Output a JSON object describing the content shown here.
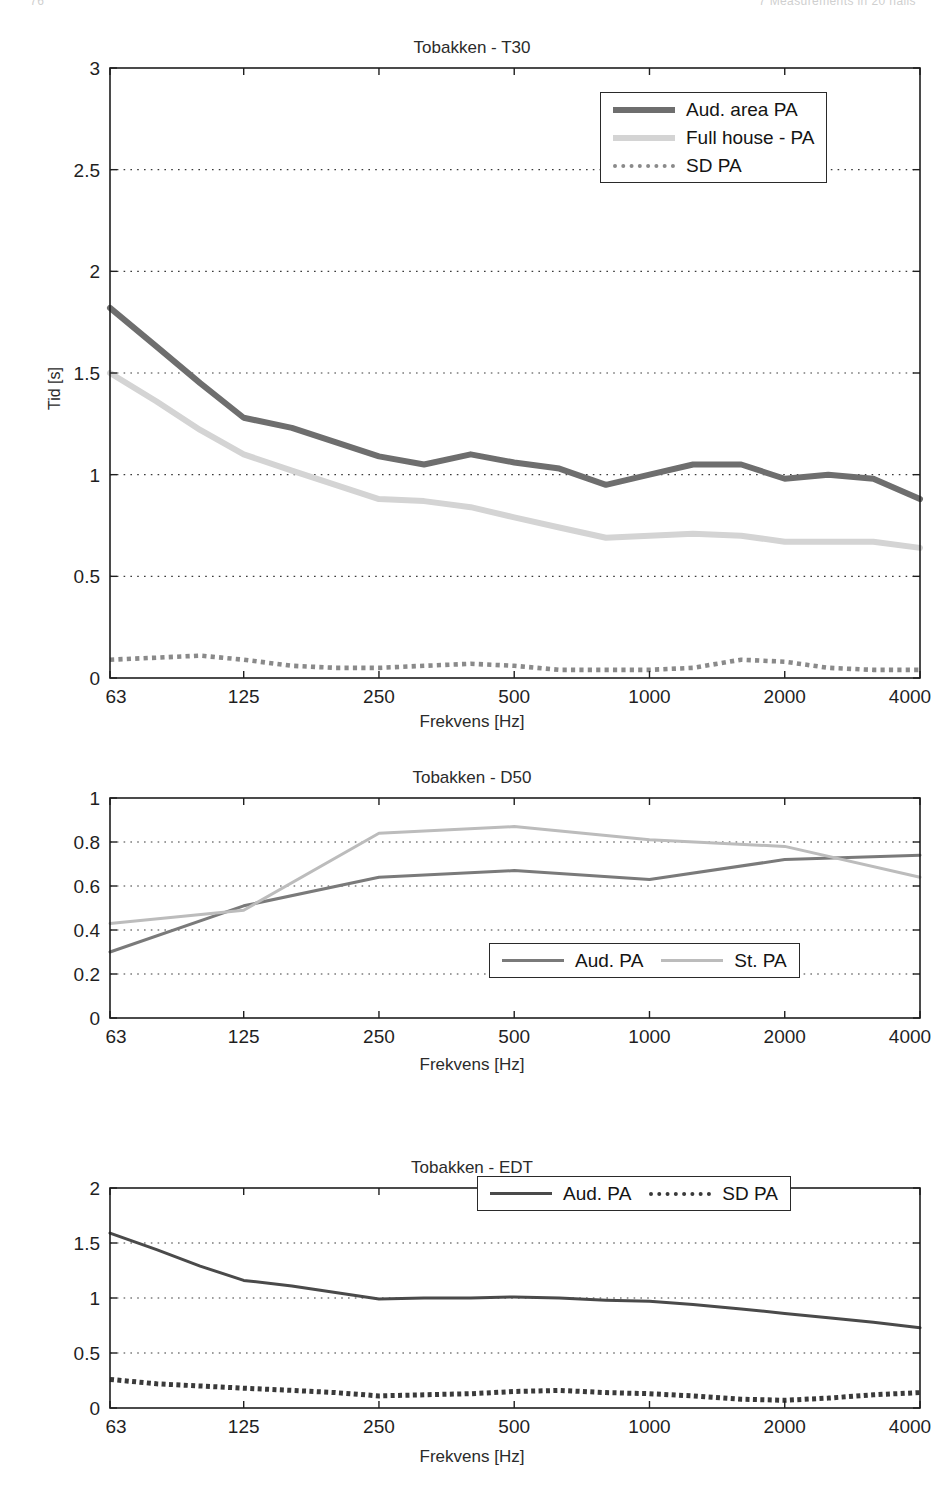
{
  "page": {
    "header_left": "76",
    "header_right": "7   Measurements in 20 halls"
  },
  "charts": [
    {
      "id": "t30",
      "title": "Tobakken - T30",
      "xlabel": "Frekvens [Hz]",
      "ylabel": "Tid [s]",
      "xticklabels": [
        "63",
        "125",
        "250",
        "500",
        "1000",
        "2000",
        "4000"
      ],
      "yticklabels": [
        "0",
        "0.5",
        "1",
        "1.5",
        "2",
        "2.5",
        "3"
      ],
      "legend": {
        "layout": "column",
        "entries": [
          {
            "label": "Aud. area PA",
            "style": "thick-solid",
            "color": "#6e6e6e"
          },
          {
            "label": "Full house - PA",
            "style": "thick-solid",
            "color": "#d4d4d4"
          },
          {
            "label": "SD PA",
            "style": "dotted",
            "color": "#8a8a8a"
          }
        ]
      }
    },
    {
      "id": "d50",
      "title": "Tobakken - D50",
      "xlabel": "Frekvens [Hz]",
      "ylabel": "",
      "xticklabels": [
        "63",
        "125",
        "250",
        "500",
        "1000",
        "2000",
        "4000"
      ],
      "yticklabels": [
        "0",
        "0.2",
        "0.4",
        "0.6",
        "0.8",
        "1"
      ],
      "legend": {
        "layout": "row",
        "entries": [
          {
            "label": "Aud. PA",
            "style": "solid",
            "color": "#7a7a7a"
          },
          {
            "label": "St. PA",
            "style": "solid",
            "color": "#bcbcbc"
          }
        ]
      }
    },
    {
      "id": "edt",
      "title": "Tobakken - EDT",
      "xlabel": "Frekvens [Hz]",
      "ylabel": "Tid [s]",
      "xticklabels": [
        "63",
        "125",
        "250",
        "500",
        "1000",
        "2000",
        "4000"
      ],
      "yticklabels": [
        "0",
        "0.5",
        "1",
        "1.5",
        "2"
      ],
      "legend": {
        "layout": "row",
        "entries": [
          {
            "label": "Aud. PA",
            "style": "solid",
            "color": "#4a4a4a"
          },
          {
            "label": "SD PA",
            "style": "dotted",
            "color": "#3a3a3a"
          }
        ]
      }
    }
  ],
  "chart_data": [
    {
      "type": "line",
      "title": "Tobakken - T30",
      "xlabel": "Frekvens [Hz]",
      "ylabel": "Tid [s]",
      "xscale": "log",
      "xlim": [
        63,
        4000
      ],
      "ylim": [
        0,
        3
      ],
      "yticks": [
        0,
        0.5,
        1,
        1.5,
        2,
        2.5,
        3
      ],
      "xticks": [
        63,
        125,
        250,
        500,
        1000,
        2000,
        4000
      ],
      "grid": "y-dotted",
      "legend_position": "top-right",
      "x": [
        63,
        80,
        100,
        125,
        160,
        200,
        250,
        315,
        400,
        500,
        630,
        800,
        1000,
        1250,
        1600,
        2000,
        2500,
        3150,
        4000
      ],
      "series": [
        {
          "name": "Aud. area PA",
          "color": "#6e6e6e",
          "style": "thick-solid",
          "values": [
            1.82,
            1.63,
            1.45,
            1.28,
            1.23,
            1.16,
            1.09,
            1.05,
            1.1,
            1.06,
            1.03,
            0.95,
            1.0,
            1.05,
            1.05,
            0.98,
            1.0,
            0.98,
            0.88
          ]
        },
        {
          "name": "Full house - PA",
          "color": "#d4d4d4",
          "style": "thick-solid",
          "values": [
            1.5,
            1.36,
            1.22,
            1.1,
            1.02,
            0.95,
            0.88,
            0.87,
            0.84,
            0.79,
            0.74,
            0.69,
            0.7,
            0.71,
            0.7,
            0.67,
            0.67,
            0.67,
            0.64
          ]
        },
        {
          "name": "SD PA",
          "color": "#8a8a8a",
          "style": "dotted",
          "values": [
            0.09,
            0.1,
            0.11,
            0.09,
            0.06,
            0.05,
            0.05,
            0.06,
            0.07,
            0.06,
            0.04,
            0.04,
            0.04,
            0.05,
            0.09,
            0.08,
            0.05,
            0.04,
            0.04,
            0.03
          ]
        }
      ]
    },
    {
      "type": "line",
      "title": "Tobakken - D50",
      "xlabel": "Frekvens [Hz]",
      "ylabel": "",
      "xscale": "log",
      "xlim": [
        63,
        4000
      ],
      "ylim": [
        0,
        1
      ],
      "yticks": [
        0,
        0.2,
        0.4,
        0.6,
        0.8,
        1
      ],
      "xticks": [
        63,
        125,
        250,
        500,
        1000,
        2000,
        4000
      ],
      "grid": "y-dotted",
      "legend_position": "bottom-right",
      "x": [
        63,
        125,
        250,
        500,
        1000,
        2000,
        4000
      ],
      "series": [
        {
          "name": "Aud. PA",
          "color": "#7a7a7a",
          "style": "solid",
          "values": [
            0.3,
            0.51,
            0.64,
            0.67,
            0.63,
            0.72,
            0.74
          ]
        },
        {
          "name": "St. PA",
          "color": "#bcbcbc",
          "style": "solid",
          "values": [
            0.43,
            0.49,
            0.84,
            0.87,
            0.81,
            0.78,
            0.64
          ]
        }
      ]
    },
    {
      "type": "line",
      "title": "Tobakken - EDT",
      "xlabel": "Frekvens [Hz]",
      "ylabel": "Tid [s]",
      "xscale": "log",
      "xlim": [
        63,
        4000
      ],
      "ylim": [
        0,
        2
      ],
      "yticks": [
        0,
        0.5,
        1,
        1.5,
        2
      ],
      "xticks": [
        63,
        125,
        250,
        500,
        1000,
        2000,
        4000
      ],
      "grid": "y-dotted",
      "legend_position": "top-right",
      "x": [
        63,
        80,
        100,
        125,
        160,
        200,
        250,
        315,
        400,
        500,
        630,
        800,
        1000,
        1250,
        1600,
        2000,
        2500,
        3150,
        4000
      ],
      "series": [
        {
          "name": "Aud. PA",
          "color": "#4a4a4a",
          "style": "solid",
          "values": [
            1.59,
            1.44,
            1.29,
            1.16,
            1.11,
            1.05,
            0.99,
            1.0,
            1.0,
            1.01,
            1.0,
            0.98,
            0.97,
            0.94,
            0.9,
            0.86,
            0.82,
            0.78,
            0.73
          ]
        },
        {
          "name": "SD PA",
          "color": "#3a3a3a",
          "style": "dotted",
          "values": [
            0.26,
            0.22,
            0.2,
            0.18,
            0.16,
            0.14,
            0.11,
            0.12,
            0.13,
            0.15,
            0.16,
            0.14,
            0.13,
            0.11,
            0.08,
            0.07,
            0.09,
            0.12,
            0.14
          ]
        }
      ]
    }
  ]
}
